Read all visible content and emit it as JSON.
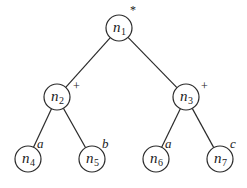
{
  "diagram": {
    "type": "expression-tree",
    "nodes": [
      {
        "id": "n1",
        "name": "n",
        "sub": "1",
        "label": "*",
        "cx": 119,
        "cy": 28,
        "lx": 130,
        "ly": 14,
        "italic_label": false
      },
      {
        "id": "n2",
        "name": "n",
        "sub": "2",
        "label": "+",
        "cx": 57,
        "cy": 97,
        "lx": 73,
        "ly": 90,
        "italic_label": false
      },
      {
        "id": "n3",
        "name": "n",
        "sub": "3",
        "label": "+",
        "cx": 186,
        "cy": 97,
        "lx": 201,
        "ly": 90,
        "italic_label": false
      },
      {
        "id": "n4",
        "name": "n",
        "sub": "4",
        "label": "a",
        "cx": 28,
        "cy": 159,
        "lx": 37,
        "ly": 148,
        "italic_label": true
      },
      {
        "id": "n5",
        "name": "n",
        "sub": "5",
        "label": "b",
        "cx": 92,
        "cy": 159,
        "lx": 102,
        "ly": 148,
        "italic_label": true
      },
      {
        "id": "n6",
        "name": "n",
        "sub": "6",
        "label": "a",
        "cx": 156,
        "cy": 159,
        "lx": 165,
        "ly": 148,
        "italic_label": true
      },
      {
        "id": "n7",
        "name": "n",
        "sub": "7",
        "label": "c",
        "cx": 220,
        "cy": 159,
        "lx": 230,
        "ly": 148,
        "italic_label": true
      }
    ],
    "edges": [
      {
        "from": "n1",
        "to": "n2"
      },
      {
        "from": "n1",
        "to": "n3"
      },
      {
        "from": "n2",
        "to": "n4"
      },
      {
        "from": "n2",
        "to": "n5"
      },
      {
        "from": "n3",
        "to": "n6"
      },
      {
        "from": "n3",
        "to": "n7"
      }
    ],
    "node_radius": 13,
    "stroke_color": "#2b2b2b"
  }
}
